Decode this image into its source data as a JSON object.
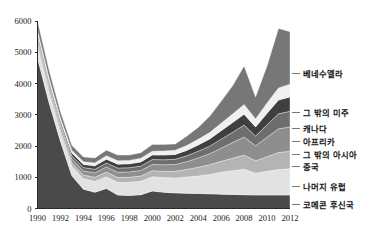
{
  "chart_data": {
    "type": "area",
    "stacked": true,
    "title": "",
    "subtitle": "",
    "xlabel": "",
    "ylabel": "",
    "xlim": [
      1990,
      2012
    ],
    "ylim": [
      0,
      6000
    ],
    "ytick_values": [
      0,
      1000,
      2000,
      3000,
      4000,
      5000,
      6000
    ],
    "ytick_labels": [
      "0",
      "1000",
      "2000",
      "3000",
      "4000",
      "5000",
      "6000"
    ],
    "xtick_values": [
      1990,
      1992,
      1994,
      1996,
      1998,
      2000,
      2002,
      2004,
      2006,
      2008,
      2010,
      2012
    ],
    "xtick_labels": [
      "1990",
      "1992",
      "1994",
      "1996",
      "1998",
      "2000",
      "2002",
      "2004",
      "2006",
      "2008",
      "2010",
      "2012"
    ],
    "grid": false,
    "legend_position": "right-outside-annotated",
    "x": [
      1990,
      1991,
      1992,
      1993,
      1994,
      1995,
      1996,
      1997,
      1998,
      1999,
      2000,
      2001,
      2002,
      2003,
      2004,
      2005,
      2006,
      2007,
      2008,
      2009,
      2010,
      2011,
      2012
    ],
    "series": [
      {
        "name": "코메콘 후신국",
        "color": "#4a4a4a",
        "values": [
          4820,
          3400,
          2150,
          1050,
          620,
          520,
          640,
          430,
          420,
          440,
          560,
          520,
          500,
          490,
          480,
          470,
          460,
          450,
          440,
          430,
          430,
          430,
          430
        ]
      },
      {
        "name": "나머지 유럽",
        "color": "#e2e2e2",
        "values": [
          330,
          280,
          260,
          300,
          330,
          350,
          380,
          400,
          420,
          430,
          460,
          470,
          480,
          520,
          560,
          620,
          700,
          760,
          820,
          700,
          760,
          820,
          840
        ]
      },
      {
        "name": "중국",
        "color": "#b4b4b4",
        "values": [
          120,
          110,
          105,
          110,
          120,
          130,
          150,
          160,
          160,
          170,
          190,
          200,
          210,
          240,
          280,
          310,
          350,
          400,
          450,
          400,
          470,
          540,
          560
        ]
      },
      {
        "name": "그 밖의 아시아",
        "color": "#8e8e8e",
        "values": [
          130,
          120,
          115,
          120,
          130,
          140,
          160,
          170,
          170,
          180,
          200,
          210,
          220,
          250,
          300,
          350,
          420,
          500,
          580,
          480,
          620,
          760,
          780
        ]
      },
      {
        "name": "아프리카",
        "color": "#6e6e6e",
        "values": [
          110,
          100,
          95,
          100,
          110,
          115,
          130,
          135,
          135,
          140,
          155,
          160,
          165,
          185,
          215,
          245,
          290,
          330,
          380,
          310,
          400,
          480,
          500
        ]
      },
      {
        "name": "캐나다",
        "color": "#3f3f3f",
        "values": [
          100,
          95,
          90,
          95,
          100,
          110,
          120,
          125,
          125,
          130,
          145,
          150,
          155,
          175,
          200,
          230,
          270,
          310,
          350,
          290,
          370,
          440,
          460
        ]
      },
      {
        "name": "그 밖의 미주",
        "color": "#f0f0f0",
        "values": [
          90,
          85,
          80,
          85,
          90,
          95,
          105,
          110,
          110,
          115,
          125,
          130,
          135,
          155,
          180,
          205,
          240,
          275,
          310,
          255,
          330,
          390,
          410
        ]
      },
      {
        "name": "베네수엘라",
        "color": "#777777",
        "values": [
          300,
          250,
          200,
          160,
          150,
          160,
          180,
          180,
          170,
          180,
          210,
          210,
          200,
          300,
          380,
          520,
          700,
          900,
          1230,
          700,
          1180,
          1900,
          1680
        ]
      }
    ]
  },
  "legend": {
    "items": [
      {
        "label": "베네수엘라",
        "color": "#777777",
        "anchor_y": 77
      },
      {
        "label": "그 밖의 미주",
        "color": "#f0f0f0",
        "anchor_y": 116
      },
      {
        "label": "캐나다",
        "color": "#3f3f3f",
        "anchor_y": 132
      },
      {
        "label": "아프리카",
        "color": "#6e6e6e",
        "anchor_y": 145
      },
      {
        "label": "그 밖의 아시아",
        "color": "#8e8e8e",
        "anchor_y": 158
      },
      {
        "label": "중국",
        "color": "#b4b4b4",
        "anchor_y": 170
      },
      {
        "label": "나머지 유럽",
        "color": "#e2e2e2",
        "anchor_y": 190
      },
      {
        "label": "코메콘 후신국",
        "color": "#4a4a4a",
        "anchor_y": 208
      }
    ]
  }
}
